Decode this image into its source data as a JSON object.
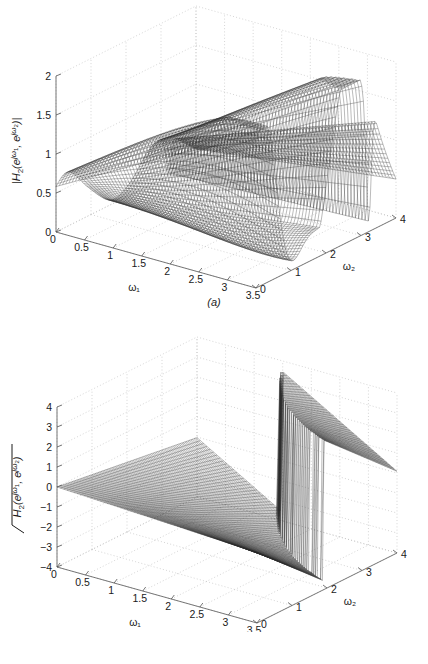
{
  "figure": {
    "kind": "two-panel 3D surface plots of a 2-D frequency response",
    "background_color": "#ffffff",
    "surface_color": "#2b2b2b",
    "grid_color": "#b9b9b9",
    "axis_color": "#555555"
  },
  "panels": [
    {
      "id": "a",
      "caption": "(a)",
      "zlabel": "|H₂(e^{jω₁}, e^{jω₂})|",
      "zlabel_parts": {
        "prefix": "|H",
        "sub1": "2",
        "open": "(e",
        "sup1": "jω",
        "sup1sub": "1",
        "comma": ", e",
        "sup2": "jω",
        "sup2sub": "2",
        "close": ")|"
      },
      "xlabel": "ω₁",
      "ylabel": "ω₂",
      "chart_data": {
        "type": "surface",
        "title": "",
        "xlabel": "ω₁",
        "ylabel": "ω₂",
        "zlabel": "|H₂(e^{jω₁}, e^{jω₂})|",
        "xticks": [
          0,
          0.5,
          1,
          1.5,
          2,
          2.5,
          3,
          3.5
        ],
        "yticks": [
          0,
          1,
          2,
          3,
          4
        ],
        "zticks": [
          0,
          0.5,
          1,
          1.5,
          2
        ],
        "xlim": [
          0,
          3.5
        ],
        "ylim": [
          0,
          4
        ],
        "zlim": [
          0,
          2
        ],
        "grid": true,
        "legend": "none",
        "description": "Magnitude response: a deep V-shaped valley running diagonally with two tall ridges rising to about 2.2, a sharp notch near ω₂≈3.2"
      }
    },
    {
      "id": "b",
      "caption": "(b)",
      "zlabel": "∠H₂(e^{jω₁}, e^{jω₂})",
      "zlabel_parts": {
        "prefix": "H",
        "sub1": "2",
        "open": "(e",
        "sup1": "jω",
        "sup1sub": "1",
        "comma": ", e",
        "sup2": "jω",
        "sup2sub": "2",
        "close": ")"
      },
      "xlabel": "ω₁",
      "ylabel": "ω₂",
      "chart_data": {
        "type": "surface",
        "title": "",
        "xlabel": "ω₁",
        "ylabel": "ω₂",
        "zlabel": "∠H₂(e^{jω₁}, e^{jω₂})",
        "xticks": [
          0,
          0.5,
          1,
          1.5,
          2,
          2.5,
          3,
          3.5
        ],
        "yticks": [
          0,
          1,
          2,
          3,
          4
        ],
        "zticks": [
          -4,
          -3,
          -2,
          -1,
          0,
          1,
          2,
          3,
          4
        ],
        "xlim": [
          0,
          3.5
        ],
        "ylim": [
          0,
          4
        ],
        "zlim": [
          -4,
          4
        ],
        "grid": true,
        "legend": "none",
        "description": "Phase response: a flat fan spreading from the origin, an abrupt 2π phase-wrap discontinuity with vertical striping near ω₂≈2, and a second narrow wrap near ω₂≈3.2"
      }
    }
  ]
}
